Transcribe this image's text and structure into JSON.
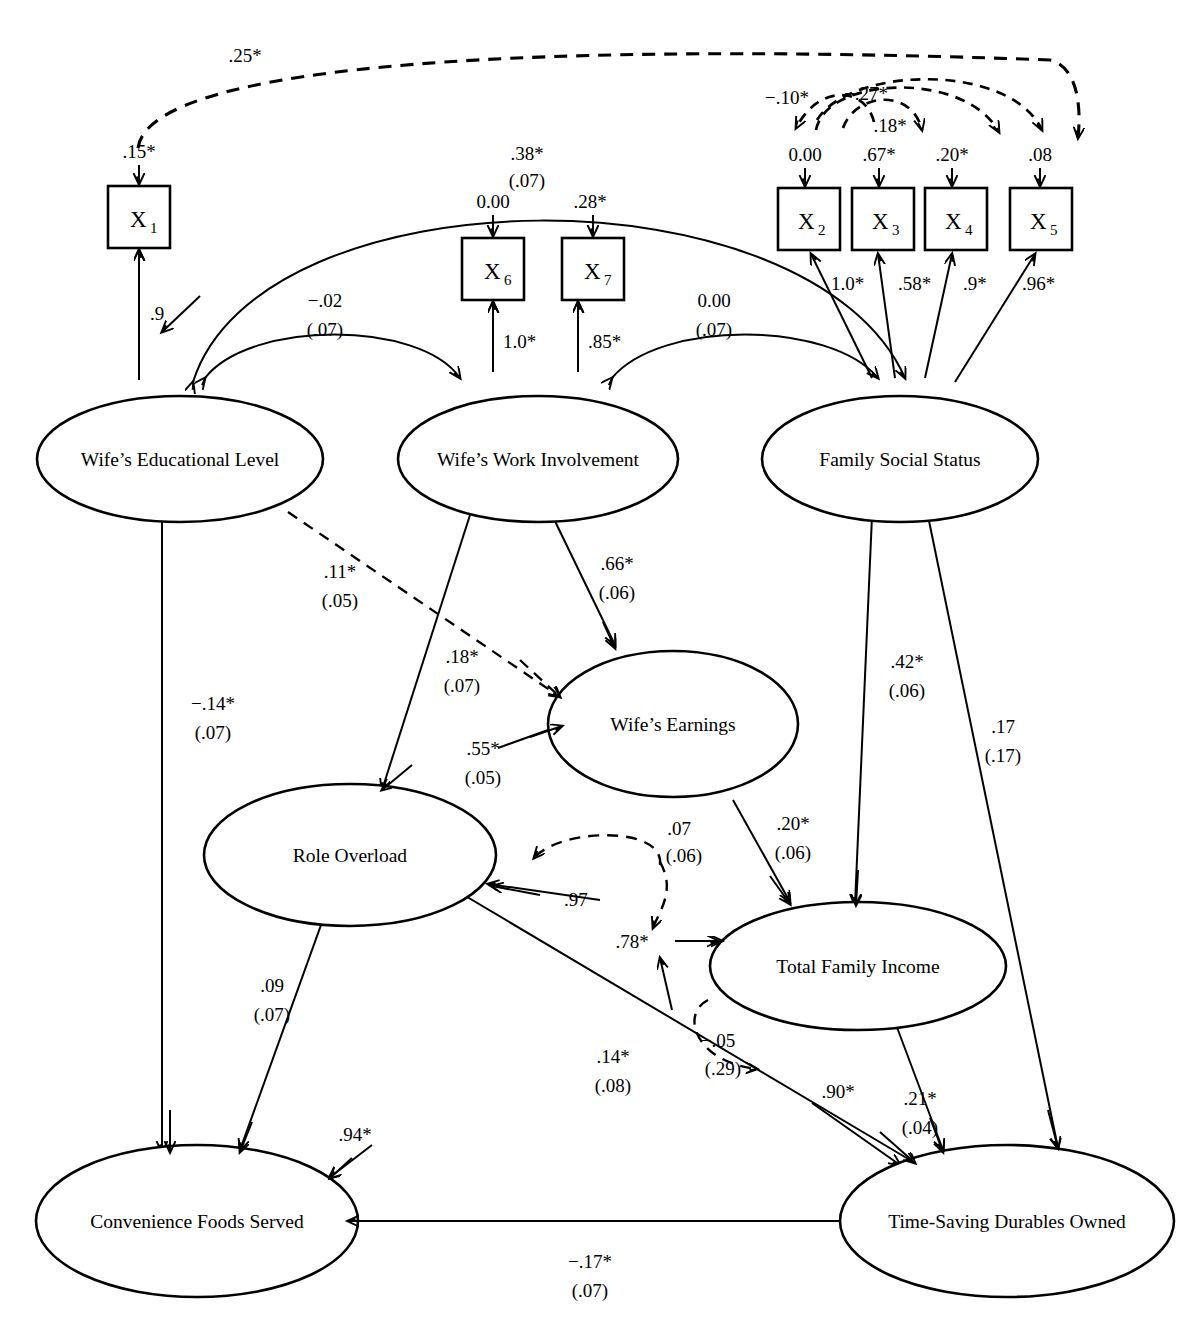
{
  "diagram": {
    "type": "structural-equation-model-path-diagram",
    "observed_variables": [
      {
        "id": "x1",
        "label": "X",
        "subscript": "1",
        "error": ".15*",
        "loading": ".9"
      },
      {
        "id": "x2",
        "label": "X",
        "subscript": "2",
        "error": "0.00",
        "loading": "1.0*"
      },
      {
        "id": "x3",
        "label": "X",
        "subscript": "3",
        "error": ".67*",
        "loading": ".58*"
      },
      {
        "id": "x4",
        "label": "X",
        "subscript": "4",
        "error": ".20*",
        "loading": ".9*"
      },
      {
        "id": "x5",
        "label": "X",
        "subscript": "5",
        "error": ".08",
        "loading": ".96*"
      },
      {
        "id": "x6",
        "label": "X",
        "subscript": "6",
        "error": "0.00",
        "loading": "1.0*"
      },
      {
        "id": "x7",
        "label": "X",
        "subscript": "7",
        "error": ".28*",
        "loading": ".85*"
      }
    ],
    "latent_variables": [
      {
        "id": "edu",
        "label": "Wife’s Educational Level"
      },
      {
        "id": "work",
        "label": "Wife’s Work Involvement"
      },
      {
        "id": "status",
        "label": "Family Social Status"
      },
      {
        "id": "earn",
        "label": "Wife’s Earnings"
      },
      {
        "id": "role",
        "label": "Role Overload"
      },
      {
        "id": "income",
        "label": "Total Family Income"
      },
      {
        "id": "food",
        "label": "Convenience Foods Served"
      },
      {
        "id": "durables",
        "label": "Time-Saving Durables Owned"
      }
    ],
    "covariances_exogenous": [
      {
        "id": "edu-work",
        "estimate": "−.02",
        "se": "(.07)"
      },
      {
        "id": "work-status",
        "estimate": "0.00",
        "se": "(.07)"
      },
      {
        "id": "edu-status",
        "estimate": ".38*",
        "se": "(.07)"
      }
    ],
    "error_covariances_dashed": [
      {
        "id": "e1-e5",
        "estimate": ".25*"
      },
      {
        "id": "e2-e3",
        "estimate": "−.10*"
      },
      {
        "id": "e2-e4",
        "estimate": "−.27*"
      },
      {
        "id": "e3-e4",
        "estimate": ".18*"
      },
      {
        "id": "role-income",
        "estimate": ".07",
        "se": "(.06)"
      },
      {
        "id": "income-durables",
        "estimate": "−.05",
        "se": "(.29)"
      }
    ],
    "structural_paths": [
      {
        "id": "edu-earn",
        "estimate": ".11*",
        "se": "(.05)",
        "style": "dashed"
      },
      {
        "id": "work-role",
        "estimate": ".18*",
        "se": "(.07)",
        "style": "solid"
      },
      {
        "id": "work-earn",
        "estimate": ".66*",
        "se": "(.06)",
        "style": "solid"
      },
      {
        "id": "edu-food",
        "estimate": "−.14*",
        "se": "(.07)",
        "style": "solid"
      },
      {
        "id": "status-income",
        "estimate": ".42*",
        "se": "(.06)",
        "style": "solid"
      },
      {
        "id": "status-durables",
        "estimate": ".17",
        "se": "(.17)",
        "style": "solid"
      },
      {
        "id": "earn-income",
        "estimate": ".20*",
        "se": "(.06)",
        "style": "solid"
      },
      {
        "id": "role-food",
        "estimate": ".09",
        "se": "(.07)",
        "style": "solid"
      },
      {
        "id": "role-durables",
        "estimate": ".14*",
        "se": "(.08)",
        "style": "solid"
      },
      {
        "id": "income-durables",
        "estimate": ".21*",
        "se": "(.04)",
        "style": "solid"
      },
      {
        "id": "durables-food",
        "estimate": "−.17*",
        "se": "(.07)",
        "style": "solid"
      }
    ],
    "disturbances": [
      {
        "id": "d-role",
        "estimate": ".97"
      },
      {
        "id": "d-income",
        "estimate": ".78*"
      },
      {
        "id": "d-durables",
        "estimate": ".90*"
      },
      {
        "id": "d-food",
        "estimate": ".94*"
      }
    ]
  }
}
